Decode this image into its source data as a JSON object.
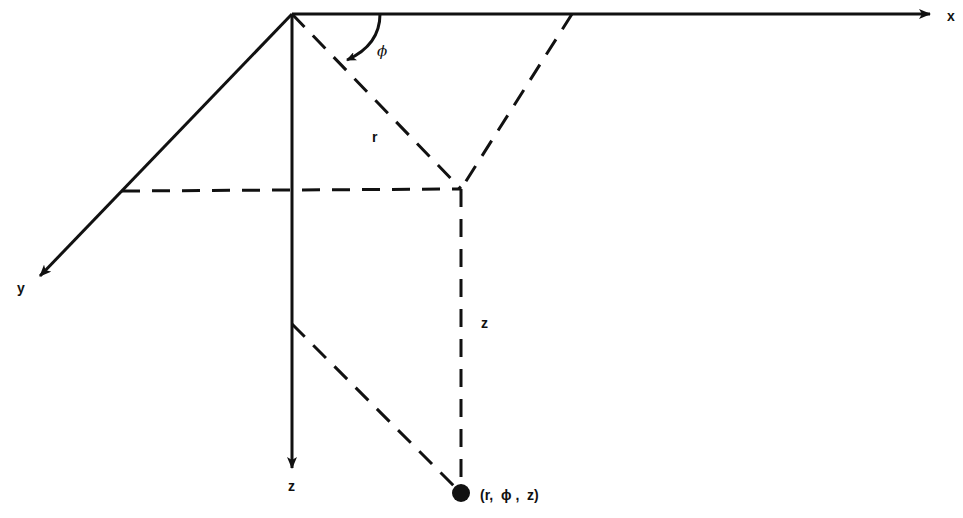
{
  "diagram": {
    "axes": {
      "x_label": "x",
      "y_label": "y",
      "z_label": "z"
    },
    "annotations": {
      "r_label": "r",
      "phi_label": "ϕ",
      "z_segment_label": "z",
      "point_label": "(r,  ϕ ,  z)"
    },
    "colors": {
      "ink": "#111111",
      "background": "#ffffff"
    }
  }
}
